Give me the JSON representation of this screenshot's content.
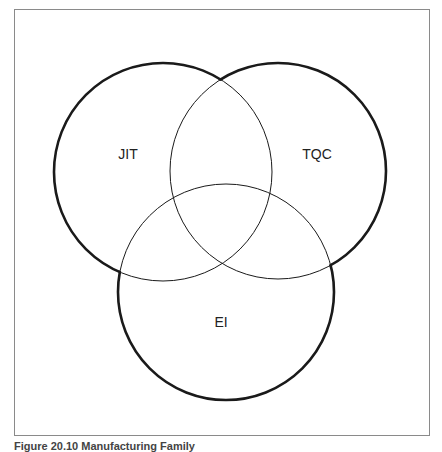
{
  "diagram": {
    "type": "venn",
    "sets": [
      {
        "id": "jit",
        "label": "JIT",
        "cx": 163,
        "cy": 172,
        "r": 109,
        "label_x": 128,
        "label_y": 154
      },
      {
        "id": "tqc",
        "label": "TQC",
        "cx": 278,
        "cy": 171,
        "r": 108,
        "label_x": 317,
        "label_y": 154
      },
      {
        "id": "ei",
        "label": "EI",
        "cx": 226,
        "cy": 292,
        "r": 108,
        "label_x": 221,
        "label_y": 322
      }
    ],
    "colors": {
      "outline": "#1a1a1a",
      "frame": "#8a8a8a"
    }
  },
  "caption": "Figure 20.10 Manufacturing Family"
}
